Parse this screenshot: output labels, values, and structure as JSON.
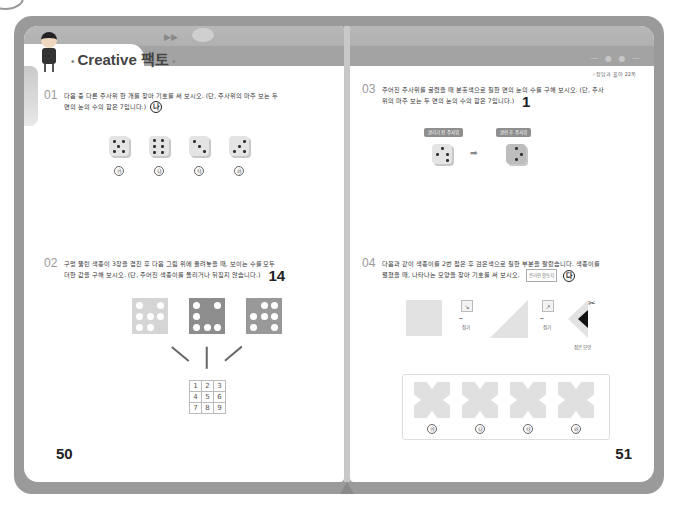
{
  "book": {
    "left_page": {
      "header": {
        "title_latin": "Creative",
        "title_korean": "팩토",
        "title_deco": "•"
      },
      "questions": [
        {
          "number": "01",
          "text_line1": "다음 중 다른 주사위 한 개를 찾아 기호를 써 보시오. (단, 주사위의 마주 보는 두",
          "text_line2": "면의 눈의 수의 합은 7입니다.)",
          "answer": "나",
          "choices": [
            "㉮",
            "㉯",
            "㉰",
            "㉱"
          ]
        },
        {
          "number": "02",
          "text_line1": "구멍 뚫린 색종이 3장을 겹친 후 다음 그림 위에 올려놓을 때, 보이는 수를 모두",
          "text_line2": "더한 값을 구해 보시오. (단, 주어진 색종이를 돌리거나 뒤집지 않습니다.)",
          "answer": "14",
          "grid": [
            [
              "1",
              "2",
              "3"
            ],
            [
              "4",
              "5",
              "6"
            ],
            [
              "7",
              "8",
              "9"
            ]
          ]
        }
      ],
      "page_number": "50"
    },
    "right_page": {
      "header": {
        "reference_note": "› 정답과 풀이 22쪽"
      },
      "questions": [
        {
          "number": "03",
          "text_line1": "주어진 주사위를 굴렸을 때 분홍색으로 칠한 면의 눈의 수를 구해 보시오. (단, 주사",
          "text_line2": "위의 마주 보는 두 면의 눈의 수의 합은 7입니다.)",
          "answer": "1",
          "tag_before": "굴리기 전 주사위",
          "tag_after": "굴린 후 주사위",
          "arrow": "➡"
        },
        {
          "number": "04",
          "text_line1": "다음과 같이 색종이를 2번 접은 후 검은색으로 칠한 부분을 잘랐습니다. 색종이를",
          "text_line2": "펼쳤을 때, 나타나는 모양을 찾아 기호를 써 보시오.",
          "hint_label": "온라인 활동지",
          "answer": "다",
          "fold_label": "접기",
          "folded_label": "접은 모양",
          "choices": [
            "㉮",
            "㉯",
            "㉰",
            "㉱"
          ]
        }
      ],
      "page_number": "51"
    }
  }
}
